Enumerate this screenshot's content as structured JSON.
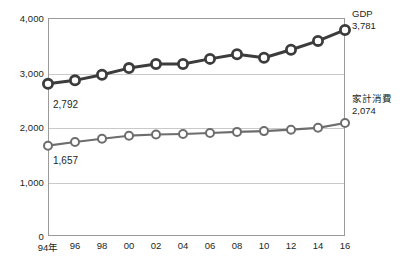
{
  "chart_data": {
    "type": "line",
    "title": "",
    "subtitle": "",
    "xlabel": "",
    "ylabel": "",
    "grid": true,
    "legend_position": "right-of-plot-endpoints",
    "x": [
      "94年",
      "96",
      "98",
      "00",
      "02",
      "04",
      "06",
      "08",
      "10",
      "12",
      "14",
      "16"
    ],
    "x_values": [
      1994,
      1996,
      1998,
      2000,
      2002,
      2004,
      2006,
      2008,
      2010,
      2012,
      2014,
      2016
    ],
    "xlim": [
      1994,
      2016
    ],
    "ylim": [
      0,
      4000
    ],
    "yticks": [
      0,
      1000,
      2000,
      3000,
      4000
    ],
    "ytick_labels": [
      "0",
      "1,000",
      "2,000",
      "3,000",
      "4,000"
    ],
    "series": [
      {
        "name": "GDP",
        "color": "#3c3c3c",
        "end_label": "GDP",
        "end_value_label": "3,781",
        "start_value_label": "2,792",
        "values": [
          2792,
          2856,
          2960,
          3081,
          3155,
          3156,
          3250,
          3335,
          3270,
          3418,
          3580,
          3781
        ]
      },
      {
        "name": "家計消費",
        "color": "#6d6d6d",
        "end_label": "家計消費",
        "end_value_label": "2,074",
        "start_value_label": "1,657",
        "values": [
          1657,
          1725,
          1785,
          1840,
          1862,
          1872,
          1890,
          1910,
          1925,
          1950,
          1985,
          2074
        ]
      }
    ],
    "annotations": [
      {
        "text": "2,792",
        "series": "GDP",
        "at_index": 0
      },
      {
        "text": "1,657",
        "series": "家計消費",
        "at_index": 0
      }
    ]
  },
  "axis": {
    "y_labels": [
      "4,000",
      "3,000",
      "2,000",
      "1,000",
      "0"
    ],
    "x_labels": [
      "94年",
      "96",
      "98",
      "00",
      "02",
      "04",
      "06",
      "08",
      "10",
      "12",
      "14",
      "16"
    ]
  },
  "labels": {
    "gdp_name": "GDP",
    "gdp_value": "3,781",
    "consumption_name": "家計消費",
    "consumption_value": "2,074",
    "gdp_start": "2,792",
    "consumption_start": "1,657"
  },
  "colors": {
    "gdp_line": "#3c3c3c",
    "consumption_line": "#6d6d6d",
    "grid": "#c9c9c9",
    "frame": "#9a9a9a",
    "text": "#231f20"
  }
}
